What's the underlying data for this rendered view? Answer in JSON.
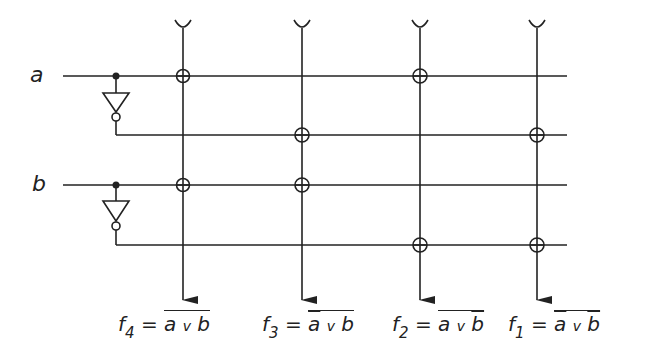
{
  "inputs": [
    {
      "label": "a"
    },
    {
      "label": "b"
    }
  ],
  "outputs": [
    {
      "name": "f",
      "index": "4",
      "eq": "=",
      "expr": [
        "a",
        "v",
        "b"
      ],
      "neg": [
        false,
        false
      ],
      "outer_bar": true
    },
    {
      "name": "f",
      "index": "3",
      "eq": "=",
      "expr": [
        "a",
        "v",
        "b"
      ],
      "neg": [
        true,
        false
      ],
      "outer_bar": true
    },
    {
      "name": "f",
      "index": "2",
      "eq": "=",
      "expr": [
        "a",
        "v",
        "b"
      ],
      "neg": [
        false,
        true
      ],
      "outer_bar": true
    },
    {
      "name": "f",
      "index": "1",
      "eq": "=",
      "expr": [
        "a",
        "v",
        "b"
      ],
      "neg": [
        true,
        true
      ],
      "outer_bar": true
    }
  ],
  "grid": {
    "rows": [
      "a",
      "not a",
      "b",
      "not b"
    ],
    "columns": [
      "f4",
      "f3",
      "f2",
      "f1"
    ],
    "connections": [
      [
        0,
        0
      ],
      [
        2,
        0
      ],
      [
        1,
        1
      ],
      [
        2,
        1
      ],
      [
        0,
        2
      ],
      [
        3,
        2
      ],
      [
        1,
        3
      ],
      [
        3,
        3
      ]
    ]
  },
  "colors": {
    "line": "#222222",
    "background": "#ffffff"
  }
}
